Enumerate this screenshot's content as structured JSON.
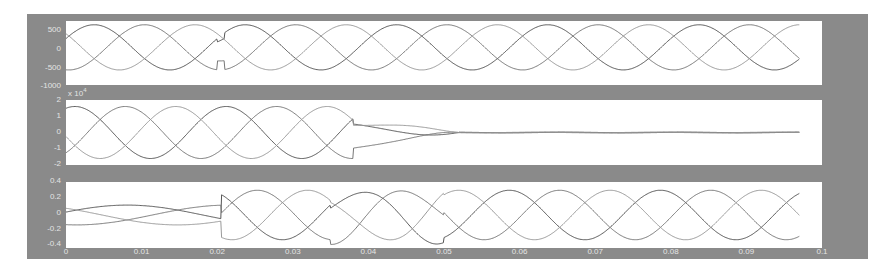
{
  "chart_data": [
    {
      "type": "line",
      "title": "",
      "xlabel": "",
      "ylabel": "",
      "xlim": [
        0,
        0.1
      ],
      "ylim": [
        -1000,
        700
      ],
      "yticks": [
        "500",
        "0",
        "-500",
        "-1000"
      ],
      "description": "Three-phase voltage waveforms, 50 Hz, amplitude ~600; brief notch disturbance near t=0.02",
      "series": [
        {
          "name": "phase-a",
          "amplitude": 600,
          "phase_deg": 0,
          "color": "#555555"
        },
        {
          "name": "phase-b",
          "amplitude": 600,
          "phase_deg": -120,
          "color": "#777777"
        },
        {
          "name": "phase-c",
          "amplitude": 600,
          "phase_deg": 120,
          "color": "#999999"
        }
      ],
      "t_end": 0.097,
      "disturbance_t": 0.0205
    },
    {
      "type": "line",
      "title": "",
      "xlabel": "",
      "ylabel": "",
      "y_exponent": "x 10^4",
      "xlim": [
        0,
        0.1
      ],
      "ylim": [
        -2,
        2
      ],
      "yticks": [
        "2",
        "1",
        "0",
        "-1",
        "-2"
      ],
      "description": "Three-phase currents (x10^4), amplitude ~1.6, decaying to zero after fault clearing around t=0.052",
      "series": [
        {
          "name": "phase-a",
          "amplitude": 1.6,
          "phase_deg": 0,
          "color": "#555555"
        },
        {
          "name": "phase-b",
          "amplitude": 1.6,
          "phase_deg": -120,
          "color": "#777777"
        },
        {
          "name": "phase-c",
          "amplitude": 1.6,
          "phase_deg": 120,
          "color": "#999999"
        }
      ],
      "fault_start": 0.038,
      "fault_end": 0.052,
      "t_end": 0.097
    },
    {
      "type": "line",
      "title": "",
      "xlabel": "",
      "ylabel": "",
      "xlim": [
        0,
        0.1
      ],
      "ylim": [
        -0.4,
        0.4
      ],
      "yticks": [
        "0.4",
        "0.2",
        "0",
        "-0.2",
        "-0.4"
      ],
      "xticks": [
        "0",
        "0.01",
        "0.02",
        "0.03",
        "0.04",
        "0.05",
        "0.06",
        "0.07",
        "0.08",
        "0.09",
        "0.1"
      ],
      "description": "Three-phase signals: small amplitude (~0.12) before t=0.02, then ~0.3 amplitude; transient 0.035-0.05",
      "series": [
        {
          "name": "phase-a",
          "amp_before": 0.12,
          "amp_after": 0.3,
          "color": "#555555"
        },
        {
          "name": "phase-b",
          "amp_before": 0.12,
          "amp_after": 0.3,
          "color": "#777777"
        },
        {
          "name": "phase-c",
          "amp_before": 0.12,
          "amp_after": 0.3,
          "color": "#999999"
        }
      ],
      "step_t": 0.0205,
      "t_end": 0.097
    }
  ],
  "axes": {
    "top": {
      "yticks": [
        "500",
        "0",
        "-500",
        "-1000"
      ]
    },
    "middle": {
      "exponent_base": "x 10",
      "exponent_power": "4",
      "yticks": [
        "2",
        "1",
        "0",
        "-1",
        "-2"
      ]
    },
    "bottom": {
      "yticks": [
        "0.4",
        "0.2",
        "0",
        "-0.2",
        "-0.4"
      ]
    },
    "xticks": [
      "0",
      "0.01",
      "0.02",
      "0.03",
      "0.04",
      "0.05",
      "0.06",
      "0.07",
      "0.08",
      "0.09",
      "0.1"
    ]
  }
}
